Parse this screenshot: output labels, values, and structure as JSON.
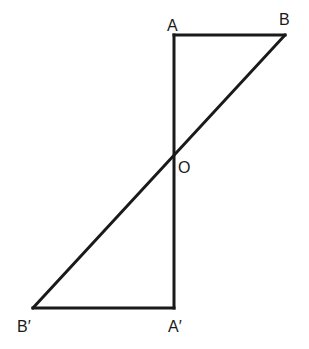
{
  "diagram": {
    "type": "geometry",
    "stroke_color": "#1a1a1a",
    "background": "#ffffff",
    "points": {
      "A": {
        "label": "A",
        "x": 174,
        "y": 35,
        "label_x": 167,
        "label_y": 31
      },
      "B": {
        "label": "B",
        "x": 285,
        "y": 35,
        "label_x": 279,
        "label_y": 25
      },
      "O": {
        "label": "O",
        "x": 174,
        "y": 154,
        "label_x": 178,
        "label_y": 173
      },
      "A2": {
        "label": "A′",
        "x": 174,
        "y": 308,
        "label_x": 168,
        "label_y": 332
      },
      "B2": {
        "label": "B′",
        "x": 33,
        "y": 308,
        "label_x": 17,
        "label_y": 332
      }
    },
    "segments": [
      {
        "from": "A",
        "to": "B"
      },
      {
        "from": "A",
        "to": "A2"
      },
      {
        "from": "A2",
        "to": "B2"
      },
      {
        "from": "B",
        "to": "B2"
      }
    ]
  }
}
